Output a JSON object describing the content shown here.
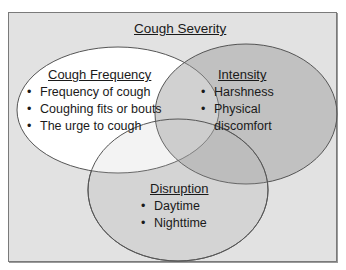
{
  "title": "Cough Severity",
  "colors": {
    "background": "#e2e2e2",
    "frame_border": "#7a7a7a",
    "frequency_fill": "#ffffff",
    "intensity_fill": "#c9c9c9",
    "disruption_fill": "#dcdcdc",
    "outline": "#555555"
  },
  "circles": [
    {
      "title": "Cough Frequency",
      "items": [
        "Frequency of cough",
        "Coughing fits or bouts",
        "The urge to cough"
      ]
    },
    {
      "title": "Intensity",
      "items": [
        "Harshness",
        "Physical discomfort"
      ]
    },
    {
      "title": "Disruption",
      "items": [
        "Daytime",
        "Nighttime"
      ]
    }
  ]
}
